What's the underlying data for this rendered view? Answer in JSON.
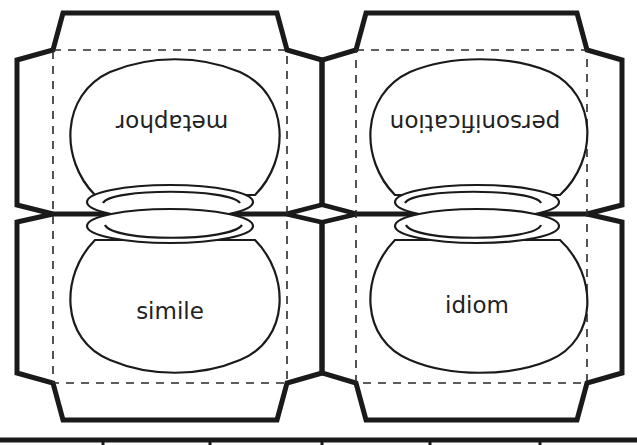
{
  "worksheet": {
    "type": "foldable cut-out template",
    "panels": [
      {
        "id": "top-left",
        "label": "metaphor",
        "orientation": "upside-down"
      },
      {
        "id": "top-right",
        "label": "personification",
        "orientation": "upside-down"
      },
      {
        "id": "bottom-left",
        "label": "simile",
        "orientation": "upright"
      },
      {
        "id": "bottom-right",
        "label": "idiom",
        "orientation": "upright"
      }
    ],
    "colors": {
      "line": "#1a1a1a",
      "background": "#ffffff",
      "text": "#222222"
    }
  }
}
